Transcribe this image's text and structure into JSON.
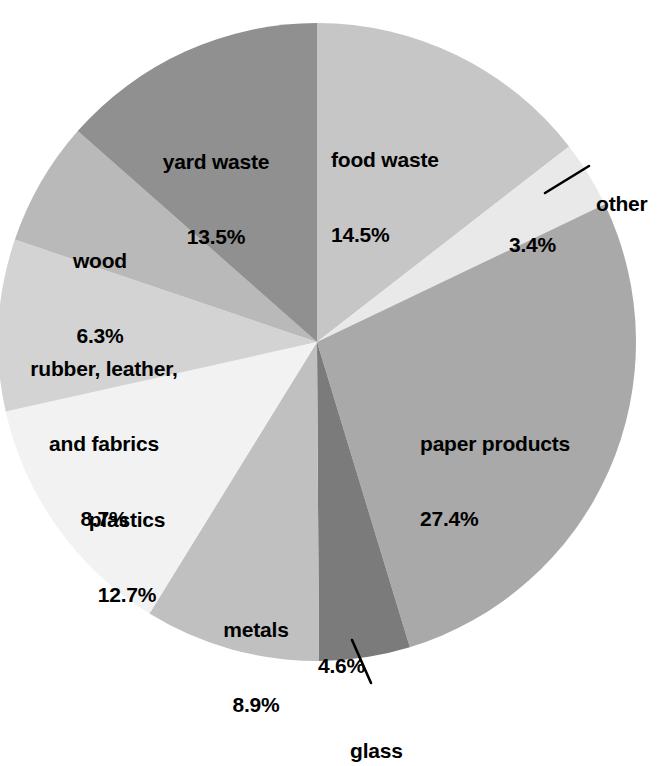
{
  "chart_data": {
    "type": "pie",
    "title": "",
    "subtitle": "",
    "xlabel": "",
    "ylabel": "",
    "legend_position": "none",
    "grid": false,
    "units": "percent",
    "start_angle_deg": 0,
    "direction": "clockwise",
    "categories": [
      "food waste",
      "other",
      "paper products",
      "glass",
      "metals",
      "plastics",
      "rubber, leather, and fabrics",
      "wood",
      "yard waste"
    ],
    "values": [
      14.5,
      3.4,
      27.4,
      4.6,
      8.9,
      12.7,
      8.7,
      6.3,
      13.5
    ],
    "value_labels": [
      "14.5%",
      "3.4%",
      "27.4%",
      "4.6%",
      "8.9%",
      "12.7%",
      "8.7%",
      "6.3%",
      "13.5%"
    ],
    "total": 100.0,
    "slice_colors": [
      "#c6c6c6",
      "#e9e9e9",
      "#a9a9a9",
      "#7b7b7b",
      "#c0c0c0",
      "#f2f2f2",
      "#d3d3d3",
      "#b9b9b9",
      "#909090"
    ]
  },
  "slices": [
    {
      "name": "food waste",
      "percent": "14.5%",
      "label_lines": [
        "food waste",
        "14.5%"
      ],
      "color": "#c6c6c6",
      "leader": false
    },
    {
      "name": "other",
      "percent": "3.4%",
      "label_lines": [
        "other"
      ],
      "color": "#e9e9e9",
      "leader": true
    },
    {
      "name": "paper products",
      "percent": "27.4%",
      "label_lines": [
        "paper products",
        "27.4%"
      ],
      "color": "#a9a9a9",
      "leader": false
    },
    {
      "name": "glass",
      "percent": "4.6%",
      "label_lines": [
        "glass"
      ],
      "color": "#7b7b7b",
      "leader": true
    },
    {
      "name": "metals",
      "percent": "8.9%",
      "label_lines": [
        "metals",
        "8.9%"
      ],
      "color": "#c0c0c0",
      "leader": false
    },
    {
      "name": "plastics",
      "percent": "12.7%",
      "label_lines": [
        "plastics",
        "12.7%"
      ],
      "color": "#f2f2f2",
      "leader": false
    },
    {
      "name": "rubber, leather, and fabrics",
      "percent": "8.7%",
      "label_lines": [
        "rubber, leather,",
        "and fabrics",
        "8.7%"
      ],
      "color": "#d3d3d3",
      "leader": false
    },
    {
      "name": "wood",
      "percent": "6.3%",
      "label_lines": [
        "wood",
        "6.3%"
      ],
      "color": "#b9b9b9",
      "leader": false
    },
    {
      "name": "yard waste",
      "percent": "13.5%",
      "label_lines": [
        "yard waste",
        "13.5%"
      ],
      "color": "#909090",
      "leader": false
    }
  ],
  "labels": {
    "food_waste_name": "food waste",
    "food_waste_pct": "14.5%",
    "other_name": "other",
    "other_pct": "3.4%",
    "paper_name": "paper products",
    "paper_pct": "27.4%",
    "glass_name": "glass",
    "glass_pct": "4.6%",
    "metals_name": "metals",
    "metals_pct": "8.9%",
    "plastics_name": "plastics",
    "plastics_pct": "12.7%",
    "rubber_name_line1": "rubber, leather,",
    "rubber_name_line2": "and fabrics",
    "rubber_pct": "8.7%",
    "wood_name": "wood",
    "wood_pct": "6.3%",
    "yard_name": "yard waste",
    "yard_pct": "13.5%"
  }
}
